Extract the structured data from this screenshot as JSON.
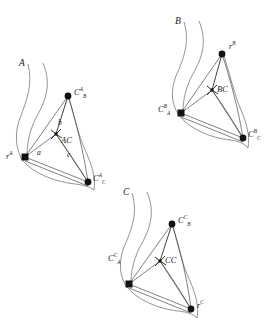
{
  "figure": {
    "title": "",
    "background_color": "#ffffff",
    "ink_color": "#1a1a1a",
    "line_color": "#2b2b2b",
    "curve_color": "#555555",
    "width": 266,
    "height": 326
  },
  "panels": [
    {
      "id": "panel-a",
      "curve_label": "A",
      "nodes": [
        {
          "name": "root",
          "base": "r",
          "sup": "A",
          "sub": "",
          "shape": "square"
        },
        {
          "name": "child-b",
          "base": "C",
          "sup": "A",
          "sub": "B",
          "shape": "circle"
        },
        {
          "name": "child-c",
          "base": "C",
          "sup": "A",
          "sub": "C",
          "shape": "circle"
        },
        {
          "name": "inner",
          "base": "AC",
          "sup": "",
          "sub": "",
          "shape": "caret"
        }
      ],
      "edge_labels": [
        "a",
        "b",
        "c"
      ]
    },
    {
      "id": "panel-b",
      "curve_label": "B",
      "nodes": [
        {
          "name": "root",
          "base": "r",
          "sup": "B",
          "sub": "",
          "shape": "circle"
        },
        {
          "name": "child-a",
          "base": "C",
          "sup": "B",
          "sub": "A",
          "shape": "square"
        },
        {
          "name": "child-c",
          "base": "C",
          "sup": "B",
          "sub": "C",
          "shape": "circle"
        },
        {
          "name": "inner",
          "base": "BC",
          "sup": "",
          "sub": "",
          "shape": "caret"
        }
      ],
      "edge_labels": []
    },
    {
      "id": "panel-c",
      "curve_label": "C",
      "nodes": [
        {
          "name": "root",
          "base": "r",
          "sup": "C",
          "sub": "",
          "shape": "circle"
        },
        {
          "name": "child-a",
          "base": "C",
          "sup": "C",
          "sub": "A",
          "shape": "square"
        },
        {
          "name": "child-b",
          "base": "C",
          "sup": "C",
          "sub": "B",
          "shape": "circle"
        },
        {
          "name": "inner",
          "base": "CC",
          "sup": "",
          "sub": "",
          "shape": "caret"
        }
      ],
      "edge_labels": []
    }
  ],
  "labels": {
    "a_curve": "A",
    "a_root": "r",
    "a_root_sup": "A",
    "a_cb": "C",
    "a_cb_sup": "A",
    "a_cb_sub": "B",
    "a_cc": "C",
    "a_cc_sup": "A",
    "a_cc_sub": "C",
    "a_inner": "AC",
    "a_edge_a": "a",
    "a_edge_b": "b",
    "a_edge_c": "c",
    "b_curve": "B",
    "b_root": "r",
    "b_root_sup": "B",
    "b_ca": "C",
    "b_ca_sup": "B",
    "b_ca_sub": "A",
    "b_cc": "C",
    "b_cc_sup": "B",
    "b_cc_sub": "C",
    "b_inner": "BC",
    "c_curve": "C",
    "c_root": "r",
    "c_root_sup": "C",
    "c_ca": "C",
    "c_ca_sup": "C",
    "c_ca_sub": "A",
    "c_cb": "C",
    "c_cb_sup": "C",
    "c_cb_sub": "B",
    "c_inner": "CC"
  }
}
